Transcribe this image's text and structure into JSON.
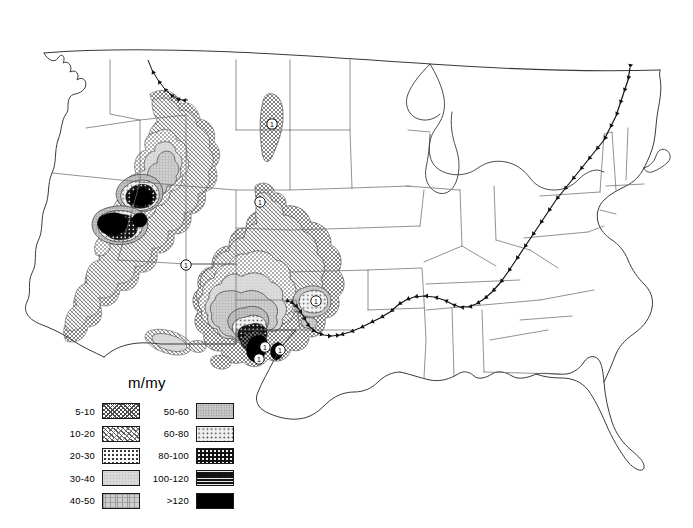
{
  "figure": {
    "kind": "contour-map",
    "region": "Contiguous United States",
    "units_title": "m/my"
  },
  "legend": {
    "title": "m/my",
    "columns": [
      {
        "name": "low-rates",
        "rows": [
          {
            "label": "5-10",
            "pattern": "p5",
            "min": 5,
            "max": 10
          },
          {
            "label": "10-20",
            "pattern": "p10",
            "min": 10,
            "max": 20
          },
          {
            "label": "20-30",
            "pattern": "p20",
            "min": 20,
            "max": 30
          },
          {
            "label": "30-40",
            "pattern": "p30",
            "min": 30,
            "max": 40
          },
          {
            "label": "40-50",
            "pattern": "p40",
            "min": 40,
            "max": 50
          }
        ]
      },
      {
        "name": "high-rates",
        "rows": [
          {
            "label": "50-60",
            "pattern": "p50",
            "min": 50,
            "max": 60
          },
          {
            "label": "60-80",
            "pattern": "p60",
            "min": 60,
            "max": 80
          },
          {
            "label": "80-100",
            "pattern": "p80",
            "min": 80,
            "max": 100
          },
          {
            "label": "100-120",
            "pattern": "p100",
            "min": 100,
            "max": 120
          },
          {
            "label": ">120",
            "pattern": "p120",
            "min": 120,
            "max": null
          }
        ]
      }
    ]
  },
  "site_markers": [
    {
      "id": "marker-montana",
      "label": "1",
      "x": 272,
      "y": 124
    },
    {
      "id": "marker-wyoming",
      "label": "1",
      "x": 260,
      "y": 202
    },
    {
      "id": "marker-utah",
      "label": "1",
      "x": 186,
      "y": 265
    },
    {
      "id": "marker-newmexico-ne",
      "label": "1",
      "x": 316,
      "y": 301
    },
    {
      "id": "marker-riogrande-n",
      "label": "1",
      "x": 265,
      "y": 347
    },
    {
      "id": "marker-riogrande-s",
      "label": "1",
      "x": 280,
      "y": 350
    },
    {
      "id": "marker-bigbend",
      "label": "1",
      "x": 259,
      "y": 359
    }
  ],
  "colors": {
    "outline": "#3a3a3a",
    "state_border": "#6e6e6e",
    "contour": "#1a1a1a",
    "fault": "#101010",
    "background": "#ffffff"
  }
}
